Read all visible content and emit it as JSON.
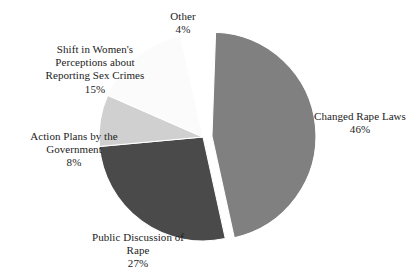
{
  "chart_data": {
    "type": "pie",
    "title": "",
    "subtitle": "",
    "xlabel": "",
    "ylabel": "",
    "legend_position": "none",
    "grid": false,
    "labels_inline": true,
    "value_unit": "%",
    "categories": [
      "Changed Rape Laws",
      "Public Discussion of Rape",
      "Action Plans by the Government",
      "Shift in Women's Perceptions about Reporting Sex Crimes",
      "Other"
    ],
    "values": [
      46,
      27,
      8,
      15,
      4
    ],
    "slices": [
      {
        "key": "changed-rape-laws",
        "label": "Changed Rape Laws",
        "label_lines": [
          "Changed Rape Laws"
        ],
        "value": 46,
        "value_text": "46%",
        "color": "#808080",
        "exploded": true
      },
      {
        "key": "public-discussion-of-rape",
        "label": "Public Discussion of Rape",
        "label_lines": [
          "Public Discussion of",
          "Rape"
        ],
        "value": 27,
        "value_text": "27%",
        "color": "#4a4a4a",
        "exploded": false
      },
      {
        "key": "action-plans-by-the-government",
        "label": "Action Plans by the Government",
        "label_lines": [
          "Action Plans by the",
          "Government"
        ],
        "value": 8,
        "value_text": "8%",
        "color": "#d0d0d0",
        "exploded": false
      },
      {
        "key": "shift-in-womens-perceptions",
        "label": "Shift in Women's Perceptions about Reporting Sex Crimes",
        "label_lines": [
          "Shift in Women's",
          "Perceptions about",
          "Reporting Sex Crimes"
        ],
        "value": 15,
        "value_text": "15%",
        "color": "#fbfbfb",
        "exploded": false
      },
      {
        "key": "other",
        "label": "Other",
        "label_lines": [
          "Other"
        ],
        "value": 4,
        "value_text": "4%",
        "color": "#ffffff",
        "exploded": false
      }
    ]
  },
  "labels": {
    "changed_laws": {
      "line1": "Changed Rape Laws",
      "value": "46%"
    },
    "public_discussion": {
      "line1": "Public Discussion of",
      "line2": "Rape",
      "value": "27%"
    },
    "action_plans": {
      "line1": "Action Plans by the",
      "line2": "Government",
      "value": "8%"
    },
    "shift": {
      "line1": "Shift in Women's",
      "line2": "Perceptions about",
      "line3": "Reporting Sex Crimes",
      "value": "15%"
    },
    "other": {
      "line1": "Other",
      "value": "4%"
    }
  },
  "colors": {
    "background": "#ffffff",
    "text": "#1c1c1c",
    "slice_border": "#ffffff",
    "changed_laws": "#808080",
    "public_discussion": "#4a4a4a",
    "action_plans": "#d0d0d0",
    "shift": "#fbfbfb",
    "other": "#ffffff"
  },
  "geometry": {
    "center_x": 203,
    "center_y": 137,
    "radius": 104,
    "start_angle_deg": -88,
    "explode_offset": 9,
    "explode_direction_deg": 45
  }
}
